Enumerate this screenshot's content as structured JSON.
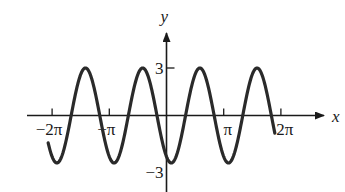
{
  "chart_data": {
    "type": "line",
    "title": "",
    "function": "y = -3cos(2x - π/6)",
    "amplitude": 3,
    "period": "π",
    "phase_shift": "π/12",
    "x_domain": [
      -6.5,
      5.95
    ],
    "xlabel": "x",
    "ylabel": "y",
    "xlim": [
      -7.0,
      7.2
    ],
    "ylim": [
      -3.6,
      4.3
    ],
    "x_ticks": [
      {
        "value": -6.2832,
        "label": "−2π"
      },
      {
        "value": -3.1416,
        "label": "−π"
      },
      {
        "value": 3.1416,
        "label": "π"
      },
      {
        "value": 6.2832,
        "label": "2π"
      }
    ],
    "y_ticks": [
      {
        "value": 3,
        "label": "3"
      },
      {
        "value": -3,
        "label": "−3"
      }
    ],
    "grid": false,
    "legend": "none",
    "line_color": "#2a2a2a"
  }
}
